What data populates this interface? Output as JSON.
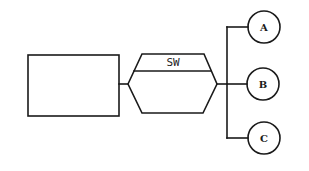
{
  "diagram": {
    "type": "network-topology",
    "nodes": [
      {
        "id": "host",
        "shape": "rectangle",
        "label": ""
      },
      {
        "id": "switch",
        "shape": "hexagon",
        "label": "SW"
      },
      {
        "id": "A",
        "shape": "circle",
        "label": "A"
      },
      {
        "id": "B",
        "shape": "circle",
        "label": "B"
      },
      {
        "id": "C",
        "shape": "circle",
        "label": "C"
      }
    ],
    "edges": [
      {
        "from": "host",
        "to": "switch"
      },
      {
        "from": "switch",
        "to": "A"
      },
      {
        "from": "switch",
        "to": "B"
      },
      {
        "from": "switch",
        "to": "C"
      }
    ]
  },
  "labels": {
    "switch": "SW",
    "a": "A",
    "b": "B",
    "c": "C"
  },
  "colors": {
    "stroke": "#1a1a1a",
    "background": "#ffffff"
  }
}
